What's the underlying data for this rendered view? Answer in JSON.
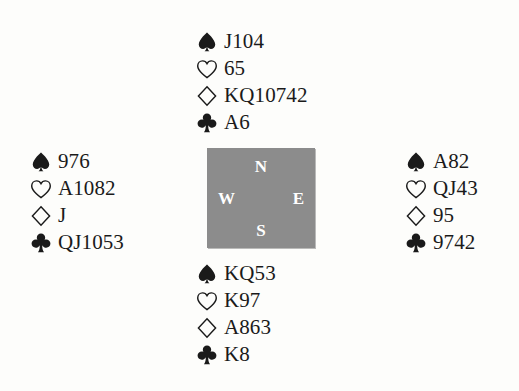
{
  "diagram": {
    "type": "bridge-deal",
    "background_color": "#fdfdfb",
    "center_box_color": "#8c8c8c",
    "center_label_color": "#ffffff",
    "symbol_color": "#1a1a1a",
    "suit_order": [
      "spade",
      "heart",
      "diamond",
      "club"
    ],
    "suit_fill": {
      "spade": "solid",
      "heart": "outline",
      "diamond": "outline",
      "club": "solid"
    }
  },
  "compass": {
    "north": "N",
    "west": "W",
    "east": "E",
    "south": "S"
  },
  "hands": {
    "north": {
      "position": "North",
      "spades": "J104",
      "hearts": "65",
      "diamonds": "KQ10742",
      "clubs": "A6"
    },
    "west": {
      "position": "West",
      "spades": "976",
      "hearts": "A1082",
      "diamonds": "J",
      "clubs": "QJ1053"
    },
    "east": {
      "position": "East",
      "spades": "A82",
      "hearts": "QJ43",
      "diamonds": "95",
      "clubs": "9742"
    },
    "south": {
      "position": "South",
      "spades": "KQ53",
      "hearts": "K97",
      "diamonds": "A863",
      "clubs": "K8"
    }
  }
}
